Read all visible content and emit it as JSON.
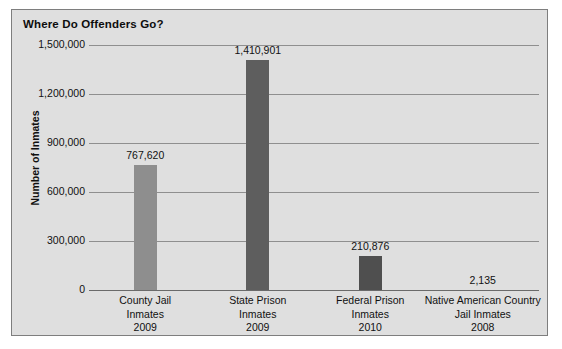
{
  "chart_data": {
    "type": "bar",
    "title": "Where Do Offenders Go?",
    "xlabel": "",
    "ylabel": "Number of Inmates",
    "categories": [
      "County Jail Inmates 2009",
      "State Prison Inmates 2009",
      "Federal Prison Inmates 2010",
      "Native American Country Jail Inmates 2008"
    ],
    "category_lines": [
      [
        "County Jail",
        "Inmates",
        "2009"
      ],
      [
        "State Prison",
        "Inmates",
        "2009"
      ],
      [
        "Federal Prison",
        "Inmates",
        "2010"
      ],
      [
        "Native American Country",
        "Jail Inmates",
        "2008"
      ]
    ],
    "values": [
      767620,
      1410901,
      210876,
      2135
    ],
    "value_labels": [
      "767,620",
      "1,410,901",
      "210,876",
      "2,135"
    ],
    "bar_colors": [
      "#8e8e8e",
      "#5e5e5e",
      "#4f4f4f",
      "#4f4f4f"
    ],
    "ylim": [
      0,
      1500000
    ],
    "yticks": [
      0,
      300000,
      600000,
      900000,
      1200000,
      1500000
    ],
    "ytick_labels": [
      "0",
      "300,000",
      "600,000",
      "900,000",
      "1,200,000",
      "1,500,000"
    ],
    "grid": true,
    "legend": "none",
    "plot_background": "#dfdfdf",
    "gridline_color": "#8f8f8f",
    "border_color": "#7e7e7e"
  }
}
